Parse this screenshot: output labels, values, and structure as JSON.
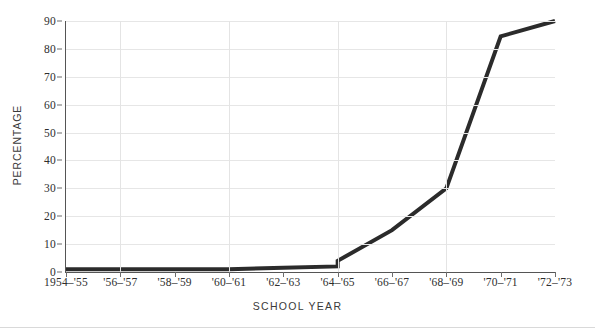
{
  "chart_data": {
    "type": "line",
    "title": "",
    "xlabel": "SCHOOL  YEAR",
    "ylabel": "PERCENTAGE",
    "ylim": [
      0,
      90
    ],
    "yticks": [
      0,
      10,
      20,
      30,
      40,
      50,
      60,
      70,
      80,
      90
    ],
    "ytick_labels": [
      "0",
      "10",
      "20",
      "30",
      "40",
      "50",
      "60",
      "70",
      "80",
      "90"
    ],
    "grid": "horizontal-and-vertical-light",
    "legend": "none",
    "categories": [
      "1954-'55",
      "'56-'57",
      "'58-'59",
      "'60-'61",
      "'62-'63",
      "'64-'65",
      "'66-'67",
      "'68-'69",
      "'70-'71",
      "'72-'73"
    ],
    "xtick_labels": [
      "1954–'55",
      "'56–'57",
      "'58–'59",
      "'60–'61",
      "'62–'63",
      "'64–'65",
      "'66–'67",
      "'68–'69",
      "'70–'71",
      "'72–'73"
    ],
    "values": [
      1,
      1,
      1,
      1,
      1.5,
      4,
      15,
      30,
      84.5,
      90
    ],
    "values_pre_step": [
      1,
      1,
      1,
      1,
      1.5,
      2,
      15,
      30,
      84.5,
      90
    ],
    "annotations": [
      "small vertical step discontinuity at '64-'65 from about 2 to about 4"
    ],
    "series": [
      {
        "name": "percentage",
        "color": "#2b2b2b",
        "line_width_px": 4,
        "values": [
          1,
          1,
          1,
          1,
          1.5,
          4,
          15,
          30,
          84.5,
          90
        ]
      }
    ]
  },
  "colors": {
    "line": "#2b2b2b",
    "grid": "#e6e6e6",
    "axis": "#555555",
    "text": "#2e2e2e",
    "background": "#ffffff"
  }
}
